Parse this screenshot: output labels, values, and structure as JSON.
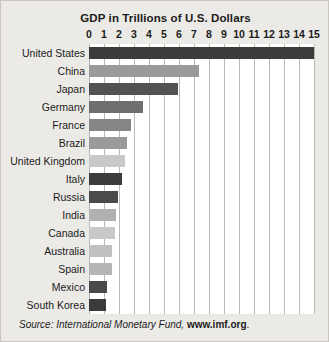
{
  "chart_data": {
    "type": "bar",
    "orientation": "horizontal",
    "title": "GDP in Trillions of U.S. Dollars",
    "xlabel": "",
    "ylabel": "",
    "xlim": [
      0,
      15
    ],
    "xticks": [
      "0",
      "1",
      "2",
      "3",
      "4",
      "5",
      "6",
      "7",
      "8",
      "9",
      "10",
      "11",
      "12",
      "13",
      "14",
      "15"
    ],
    "grid": true,
    "legend": false,
    "categories": [
      "United States",
      "China",
      "Japan",
      "Germany",
      "France",
      "Brazil",
      "United Kingdom",
      "Italy",
      "Russia",
      "India",
      "Canada",
      "Australia",
      "Spain",
      "Mexico",
      "South Korea"
    ],
    "values": [
      15.0,
      7.3,
      5.9,
      3.6,
      2.8,
      2.5,
      2.4,
      2.2,
      1.9,
      1.8,
      1.7,
      1.5,
      1.5,
      1.2,
      1.1
    ],
    "bar_colors": [
      "#3b3b3b",
      "#9a9a9a",
      "#525252",
      "#6f6f6f",
      "#868686",
      "#9a9a9a",
      "#c8c8c8",
      "#3b3b3b",
      "#4a4a4a",
      "#b0b0b0",
      "#c8c8c8",
      "#c0c0c0",
      "#b6b6b6",
      "#4a4a4a",
      "#3b3b3b"
    ]
  },
  "source": {
    "prefix": "Source: International Monetary Fund, ",
    "url": "www.imf.org",
    "suffix": "."
  },
  "colors": {
    "figure_background": "#eceae6",
    "plot_background": "#ffffff",
    "gridline": "#bcb9b4",
    "text": "#1b1b1b"
  }
}
